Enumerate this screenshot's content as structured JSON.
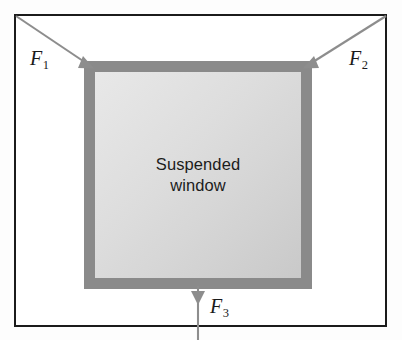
{
  "figure": {
    "name": "suspended-window-force-diagram",
    "background_color": "#ffffff",
    "border_color": "#1b1b1b",
    "width": 402,
    "height": 340
  },
  "window": {
    "label": "Suspended\nwindow",
    "sash_color": "#8a8a8a",
    "pane_color_light": "#e8e8e8",
    "pane_color_dark": "#c9c9c9"
  },
  "forces": [
    {
      "name": "F1",
      "label": "F",
      "subscript": "1",
      "direction": "up-left",
      "tail": [
        16,
        16
      ],
      "tip": [
        85,
        62
      ],
      "color": "#8a8a8a",
      "description": "cable tension at upper-left corner"
    },
    {
      "name": "F2",
      "label": "F",
      "subscript": "2",
      "direction": "up-right",
      "tail": [
        386,
        16
      ],
      "tip": [
        311,
        62
      ],
      "color": "#8a8a8a",
      "description": "cable tension at upper-right corner"
    },
    {
      "name": "F3",
      "label": "F",
      "subscript": "3",
      "direction": "down",
      "tail": [
        198,
        288
      ],
      "tip": [
        198,
        340
      ],
      "color": "#8a8a8a",
      "description": "downward force at bottom edge"
    }
  ]
}
